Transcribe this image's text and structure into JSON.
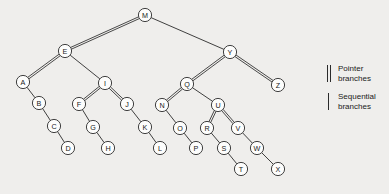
{
  "figure": {
    "name": "binary-tree-pointer-sequential-branches",
    "background_color": "#efeeec",
    "node_stroke_color": "#2b2b2b",
    "node_fill_color": "#fdfdfc",
    "node_radius": 6.6
  },
  "nodes": [
    {
      "id": "M",
      "label": "M",
      "x": 145,
      "y": 15
    },
    {
      "id": "E",
      "label": "E",
      "x": 65,
      "y": 51
    },
    {
      "id": "Y",
      "label": "Y",
      "x": 230,
      "y": 52
    },
    {
      "id": "A",
      "label": "A",
      "x": 23,
      "y": 82
    },
    {
      "id": "I",
      "label": "I",
      "x": 105,
      "y": 83
    },
    {
      "id": "Q",
      "label": "Q",
      "x": 187,
      "y": 84
    },
    {
      "id": "Z",
      "label": "Z",
      "x": 278,
      "y": 85
    },
    {
      "id": "B",
      "label": "B",
      "x": 39,
      "y": 103
    },
    {
      "id": "F",
      "label": "F",
      "x": 79,
      "y": 104
    },
    {
      "id": "J",
      "label": "J",
      "x": 127,
      "y": 104
    },
    {
      "id": "N",
      "label": "N",
      "x": 162,
      "y": 105
    },
    {
      "id": "U",
      "label": "U",
      "x": 218,
      "y": 105
    },
    {
      "id": "C",
      "label": "C",
      "x": 54,
      "y": 126
    },
    {
      "id": "G",
      "label": "G",
      "x": 93,
      "y": 127
    },
    {
      "id": "K",
      "label": "K",
      "x": 145,
      "y": 127
    },
    {
      "id": "O",
      "label": "O",
      "x": 180,
      "y": 128
    },
    {
      "id": "R",
      "label": "R",
      "x": 207,
      "y": 128
    },
    {
      "id": "V",
      "label": "V",
      "x": 238,
      "y": 128
    },
    {
      "id": "D",
      "label": "D",
      "x": 68,
      "y": 148
    },
    {
      "id": "H",
      "label": "H",
      "x": 108,
      "y": 148
    },
    {
      "id": "L",
      "label": "L",
      "x": 160,
      "y": 148
    },
    {
      "id": "P",
      "label": "P",
      "x": 196,
      "y": 148
    },
    {
      "id": "S",
      "label": "S",
      "x": 224,
      "y": 148
    },
    {
      "id": "W",
      "label": "W",
      "x": 257,
      "y": 148
    },
    {
      "id": "T",
      "label": "T",
      "x": 241,
      "y": 169
    },
    {
      "id": "X",
      "label": "X",
      "x": 278,
      "y": 169
    }
  ],
  "edges": [
    {
      "from": "M",
      "to": "E",
      "kind": "pointer"
    },
    {
      "from": "M",
      "to": "Y",
      "kind": "sequential"
    },
    {
      "from": "E",
      "to": "A",
      "kind": "pointer"
    },
    {
      "from": "E",
      "to": "I",
      "kind": "sequential"
    },
    {
      "from": "Y",
      "to": "Q",
      "kind": "pointer"
    },
    {
      "from": "Y",
      "to": "Z",
      "kind": "pointer"
    },
    {
      "from": "A",
      "to": "B",
      "kind": "sequential"
    },
    {
      "from": "B",
      "to": "C",
      "kind": "sequential"
    },
    {
      "from": "C",
      "to": "D",
      "kind": "sequential"
    },
    {
      "from": "I",
      "to": "F",
      "kind": "pointer"
    },
    {
      "from": "I",
      "to": "J",
      "kind": "pointer"
    },
    {
      "from": "F",
      "to": "G",
      "kind": "sequential"
    },
    {
      "from": "G",
      "to": "H",
      "kind": "sequential"
    },
    {
      "from": "J",
      "to": "K",
      "kind": "sequential"
    },
    {
      "from": "K",
      "to": "L",
      "kind": "sequential"
    },
    {
      "from": "Q",
      "to": "N",
      "kind": "pointer"
    },
    {
      "from": "Q",
      "to": "U",
      "kind": "sequential"
    },
    {
      "from": "N",
      "to": "O",
      "kind": "sequential"
    },
    {
      "from": "O",
      "to": "P",
      "kind": "sequential"
    },
    {
      "from": "U",
      "to": "R",
      "kind": "pointer"
    },
    {
      "from": "U",
      "to": "V",
      "kind": "pointer"
    },
    {
      "from": "R",
      "to": "S",
      "kind": "sequential"
    },
    {
      "from": "S",
      "to": "T",
      "kind": "sequential"
    },
    {
      "from": "V",
      "to": "W",
      "kind": "sequential"
    },
    {
      "from": "W",
      "to": "X",
      "kind": "sequential"
    }
  ],
  "legend": {
    "items": [
      {
        "mark": "double-bar",
        "line1": "Pointer",
        "line2": "branches"
      },
      {
        "mark": "single-bar",
        "line1": "Sequential",
        "line2": "branches"
      }
    ]
  }
}
